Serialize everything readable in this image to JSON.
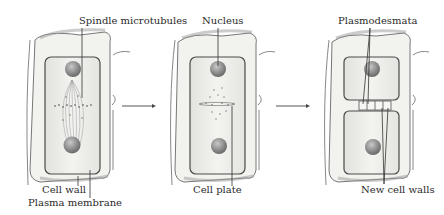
{
  "diagram": {
    "stages": [
      {
        "name": "spindle-stage",
        "labels": {
          "top": "Spindle microtubules",
          "bottom_1": "Cell wall",
          "bottom_2": "Plasma membrane"
        }
      },
      {
        "name": "cell-plate-stage",
        "labels": {
          "top": "Nucleus",
          "bottom_1": "Cell plate"
        }
      },
      {
        "name": "new-walls-stage",
        "labels": {
          "top": "Plasmodesmata",
          "bottom_1": "New cell walls"
        }
      }
    ],
    "colors": {
      "wall_fill": "#f4f4f1",
      "wall_shade": "#9a9a9a",
      "membrane": "#4a4a4a",
      "cytoplasm": "#ecece8",
      "nucleus": "#8a8a8a",
      "label_line": "#333333",
      "arrow": "#555555"
    }
  }
}
